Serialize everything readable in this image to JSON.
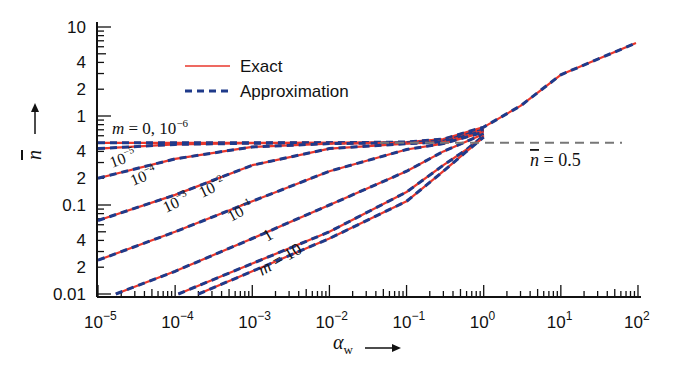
{
  "chart_data": {
    "type": "line",
    "title": "",
    "xlabel": "α_w",
    "ylabel": "n̄",
    "xscale": "log",
    "yscale": "log",
    "xlim": [
      1e-05,
      100
    ],
    "ylim": [
      0.01,
      10
    ],
    "x_ticks": [
      "10^-5",
      "10^-4",
      "10^-3",
      "10^-2",
      "10^-1",
      "10^0",
      "10^1",
      "10^2"
    ],
    "y_ticks": [
      {
        "value": 10,
        "label": "10"
      },
      {
        "value": 4,
        "label": "4"
      },
      {
        "value": 2,
        "label": "2"
      },
      {
        "value": 1,
        "label": "1"
      },
      {
        "value": 0.4,
        "label": "4"
      },
      {
        "value": 0.2,
        "label": "2"
      },
      {
        "value": 0.1,
        "label": "0.1"
      },
      {
        "value": 0.04,
        "label": "4"
      },
      {
        "value": 0.02,
        "label": "2"
      },
      {
        "value": 0.01,
        "label": "0.01"
      }
    ],
    "legend": [
      {
        "name": "Exact",
        "style": "solid",
        "color": "#e8372c"
      },
      {
        "name": "Approximation",
        "style": "dashed",
        "color": "#1f3a8a"
      }
    ],
    "legend_position": "upper-left-inside",
    "grid": false,
    "reference_line": {
      "y": 0.5,
      "label": "n̄ = 0.5",
      "style": "dashed",
      "color": "#777777"
    },
    "series": [
      {
        "name": "m = 0, 10^-6",
        "label": "m = 0, 10⁻⁶",
        "x": [
          1e-05,
          0.0001,
          0.001,
          0.01,
          0.1,
          0.3,
          1,
          3,
          10,
          30,
          100
        ],
        "y": [
          0.5,
          0.5,
          0.5,
          0.5,
          0.51,
          0.55,
          0.75,
          1.3,
          2.9,
          7.0,
          18
        ]
      },
      {
        "name": "10^-5",
        "label": "10⁻⁵",
        "x": [
          1e-05,
          0.0001,
          0.001,
          0.01,
          0.1,
          0.3,
          1
        ],
        "y": [
          0.43,
          0.48,
          0.495,
          0.5,
          0.5,
          0.53,
          0.72
        ]
      },
      {
        "name": "10^-4",
        "label": "10⁻⁴",
        "x": [
          1e-05,
          0.0001,
          0.001,
          0.01,
          0.1,
          0.3,
          1
        ],
        "y": [
          0.2,
          0.33,
          0.45,
          0.49,
          0.5,
          0.52,
          0.7
        ]
      },
      {
        "name": "10^-3",
        "label": "10⁻³",
        "x": [
          1e-05,
          0.0001,
          0.001,
          0.01,
          0.1,
          0.3,
          1
        ],
        "y": [
          0.067,
          0.13,
          0.28,
          0.43,
          0.49,
          0.51,
          0.68
        ]
      },
      {
        "name": "10^-2",
        "label": "10⁻²",
        "x": [
          1e-05,
          0.0001,
          0.001,
          0.01,
          0.1,
          0.3,
          1
        ],
        "y": [
          0.024,
          0.05,
          0.11,
          0.24,
          0.42,
          0.49,
          0.66
        ]
      },
      {
        "name": "10^-1",
        "label": "10⁻¹",
        "x": [
          1.7e-05,
          0.0001,
          0.001,
          0.01,
          0.1,
          0.3,
          1
        ],
        "y": [
          0.01,
          0.018,
          0.042,
          0.1,
          0.24,
          0.4,
          0.63
        ]
      },
      {
        "name": "1",
        "label": "1",
        "x": [
          0.00011,
          0.001,
          0.01,
          0.1,
          0.3,
          0.6,
          1
        ],
        "y": [
          0.01,
          0.022,
          0.05,
          0.14,
          0.28,
          0.42,
          0.6
        ]
      },
      {
        "name": "m = 10",
        "label": "m = 10",
        "x": [
          0.0002,
          0.001,
          0.01,
          0.1,
          0.3,
          0.6,
          1
        ],
        "y": [
          0.01,
          0.018,
          0.042,
          0.11,
          0.24,
          0.4,
          0.58
        ]
      }
    ]
  },
  "labels": {
    "xlabel_text": "α",
    "xlabel_sub": "w",
    "ylabel_text": "n",
    "ref_label": "n = 0.5",
    "legend_exact": "Exact",
    "legend_approx": "Approximation"
  },
  "colors": {
    "exact": "#e8372c",
    "approx": "#1f3a8a",
    "axis": "#111111",
    "ref": "#777777"
  }
}
